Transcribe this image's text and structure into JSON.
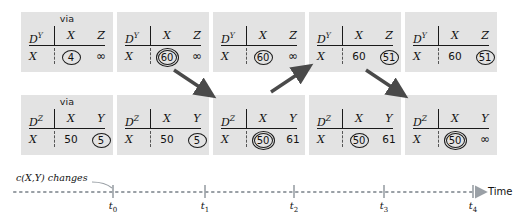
{
  "diagram": {
    "via_label": "via",
    "change_annotation": "c(X,Y) changes",
    "time_axis_label": "Time"
  },
  "colors": {
    "card_background": "#e3e3e3",
    "page_background": "#ffffff",
    "ink": "#1a1a1a",
    "arrow": "#4a4a4a",
    "timeline": "#9aa0a6"
  },
  "top_row": {
    "row_name": "DY-tables",
    "cards": [
      {
        "id": "dy-t0",
        "show_via": true,
        "table_name": "D",
        "table_sup": "Y",
        "columns": [
          "X",
          "Z"
        ],
        "row_label": "X",
        "values": [
          {
            "text": "4",
            "circled": "single"
          },
          {
            "text": "∞",
            "circled": "none"
          }
        ]
      },
      {
        "id": "dy-t1",
        "show_via": false,
        "table_name": "D",
        "table_sup": "Y",
        "columns": [
          "X",
          "Z"
        ],
        "row_label": "X",
        "values": [
          {
            "text": "60",
            "circled": "double"
          },
          {
            "text": "∞",
            "circled": "none"
          }
        ]
      },
      {
        "id": "dy-t2",
        "show_via": false,
        "table_name": "D",
        "table_sup": "Y",
        "columns": [
          "X",
          "Z"
        ],
        "row_label": "X",
        "values": [
          {
            "text": "60",
            "circled": "single"
          },
          {
            "text": "∞",
            "circled": "none"
          }
        ]
      },
      {
        "id": "dy-t3",
        "show_via": false,
        "table_name": "D",
        "table_sup": "Y",
        "columns": [
          "X",
          "Z"
        ],
        "row_label": "X",
        "values": [
          {
            "text": "60",
            "circled": "none"
          },
          {
            "text": "51",
            "circled": "single"
          }
        ]
      },
      {
        "id": "dy-t4",
        "show_via": false,
        "table_name": "D",
        "table_sup": "Y",
        "columns": [
          "X",
          "Z"
        ],
        "row_label": "X",
        "values": [
          {
            "text": "60",
            "circled": "none"
          },
          {
            "text": "51",
            "circled": "single"
          }
        ]
      }
    ]
  },
  "bottom_row": {
    "row_name": "DZ-tables",
    "cards": [
      {
        "id": "dz-t0",
        "show_via": true,
        "table_name": "D",
        "table_sup": "Z",
        "columns": [
          "X",
          "Y"
        ],
        "row_label": "X",
        "values": [
          {
            "text": "50",
            "circled": "none"
          },
          {
            "text": "5",
            "circled": "single"
          }
        ]
      },
      {
        "id": "dz-t1",
        "show_via": false,
        "table_name": "D",
        "table_sup": "Z",
        "columns": [
          "X",
          "Y"
        ],
        "row_label": "X",
        "values": [
          {
            "text": "50",
            "circled": "none"
          },
          {
            "text": "5",
            "circled": "single"
          }
        ]
      },
      {
        "id": "dz-t2",
        "show_via": false,
        "table_name": "D",
        "table_sup": "Z",
        "columns": [
          "X",
          "Y"
        ],
        "row_label": "X",
        "values": [
          {
            "text": "50",
            "circled": "double"
          },
          {
            "text": "61",
            "circled": "none"
          }
        ]
      },
      {
        "id": "dz-t3",
        "show_via": false,
        "table_name": "D",
        "table_sup": "Z",
        "columns": [
          "X",
          "Y"
        ],
        "row_label": "X",
        "values": [
          {
            "text": "50",
            "circled": "single"
          },
          {
            "text": "61",
            "circled": "none"
          }
        ]
      },
      {
        "id": "dz-t4",
        "show_via": false,
        "table_name": "D",
        "table_sup": "Z",
        "columns": [
          "X",
          "Y"
        ],
        "row_label": "X",
        "values": [
          {
            "text": "50",
            "circled": "double"
          },
          {
            "text": "∞",
            "circled": "none"
          }
        ]
      }
    ]
  },
  "arrows": [
    {
      "name": "arrow-t1-down",
      "from": "dy-t1",
      "to": "dz-t2",
      "direction": "down-right"
    },
    {
      "name": "arrow-t2-up",
      "from": "dz-t2",
      "to": "dy-t3",
      "direction": "up-right"
    },
    {
      "name": "arrow-t3-down",
      "from": "dy-t3",
      "to": "dz-t4",
      "direction": "down-right"
    }
  ],
  "timeline": {
    "ticks": [
      {
        "label": "t",
        "sub": "0"
      },
      {
        "label": "t",
        "sub": "1"
      },
      {
        "label": "t",
        "sub": "2"
      },
      {
        "label": "t",
        "sub": "3"
      },
      {
        "label": "t",
        "sub": "4"
      }
    ]
  }
}
